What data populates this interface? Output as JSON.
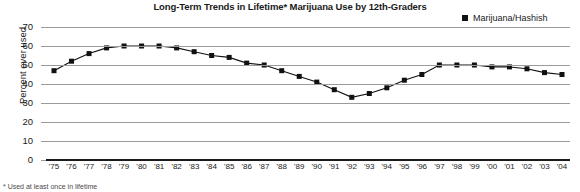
{
  "chart_data": {
    "type": "line",
    "title": "Long-Term Trends in Lifetime* Marijuana Use by 12th-Graders",
    "xlabel": "",
    "ylabel": "Percent ever used",
    "ylim": [
      0,
      70
    ],
    "ytick_step": 10,
    "yticks": [
      "70",
      "60",
      "50",
      "40",
      "30",
      "20",
      "10",
      "0"
    ],
    "grid": true,
    "legend_position": "top-right",
    "legend": [
      "Marijuana/Hashish"
    ],
    "marker": "square",
    "marker_color": "#111111",
    "line_color": "#111111",
    "grid_color": "#9b9b9b",
    "categories": [
      "'75",
      "'76",
      "'77",
      "'78",
      "'79",
      "'80",
      "'81",
      "'82",
      "'83",
      "'84",
      "'85",
      "'86",
      "'87",
      "'88",
      "'89",
      "'90",
      "'91",
      "'92",
      "'93",
      "'94",
      "'95",
      "'96",
      "'97",
      "'98",
      "'99",
      "'00",
      "'01",
      "'02",
      "'03",
      "'04"
    ],
    "series": [
      {
        "name": "Marijuana/Hashish",
        "values": [
          47,
          52,
          56,
          59,
          60,
          60,
          60,
          59,
          57,
          55,
          54,
          51,
          50,
          47,
          44,
          41,
          37,
          33,
          35,
          38,
          42,
          45,
          50,
          50,
          50,
          49,
          49,
          48,
          46,
          45
        ]
      }
    ]
  },
  "footnote": "* Used at least once in lifetime",
  "legend_icon": "square-swatch-icon"
}
